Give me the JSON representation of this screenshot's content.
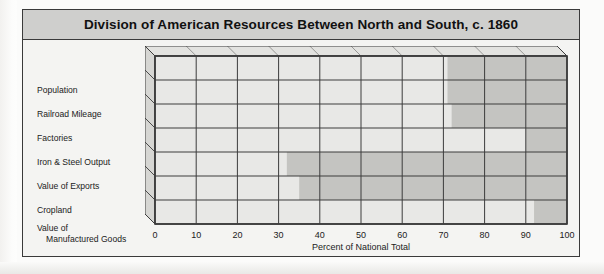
{
  "figure": {
    "title": "Division of American Resources Between North and South, c. 1860"
  },
  "axis": {
    "x_title": "Percent of National Total",
    "ticks": [
      "0",
      "10",
      "20",
      "30",
      "40",
      "50",
      "60",
      "70",
      "80",
      "90",
      "100"
    ]
  },
  "categories": [
    {
      "line1": "Population",
      "line2": ""
    },
    {
      "line1": "Railroad Mileage",
      "line2": ""
    },
    {
      "line1": "Factories",
      "line2": ""
    },
    {
      "line1": "Iron & Steel Output",
      "line2": ""
    },
    {
      "line1": "Value of Exports",
      "line2": ""
    },
    {
      "line1": "Cropland",
      "line2": ""
    },
    {
      "line1": "Value of",
      "line2": "Manufactured Goods"
    }
  ],
  "colors": {
    "north_fill": "#e8e8e6",
    "south_fill": "#c4c4c1",
    "grid_line": "#3c3c3c",
    "side_panel": "#d6d6d3",
    "title_bar": "#cfcfcd",
    "frame": "#3a3a3a"
  },
  "chart_data": {
    "type": "bar",
    "orientation": "horizontal",
    "stacked": true,
    "title": "Division of American Resources Between North and South, c. 1860",
    "xlabel": "Percent of National Total",
    "ylabel": "",
    "xlim": [
      0,
      100
    ],
    "xticks": [
      0,
      10,
      20,
      30,
      40,
      50,
      60,
      70,
      80,
      90,
      100
    ],
    "grid": true,
    "legend": "none",
    "categories": [
      "Population",
      "Railroad Mileage",
      "Factories",
      "Iron & Steel Output",
      "Value of Exports",
      "Cropland",
      "Value of Manufactured Goods"
    ],
    "series": [
      {
        "name": "North",
        "values": [
          71,
          71,
          72,
          90,
          32,
          35,
          92
        ]
      },
      {
        "name": "South",
        "values": [
          29,
          29,
          28,
          10,
          68,
          65,
          8
        ]
      }
    ]
  }
}
